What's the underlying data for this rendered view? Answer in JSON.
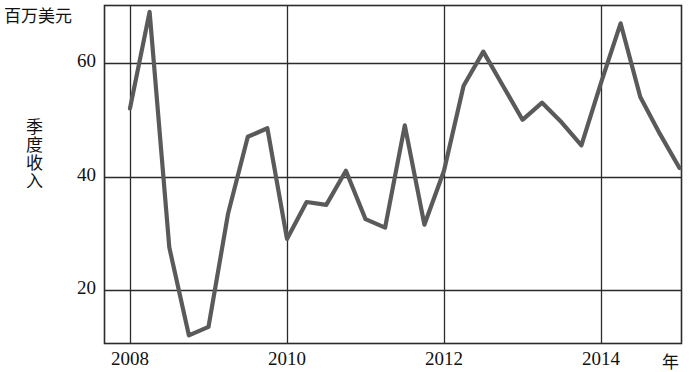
{
  "chart_data": {
    "type": "line",
    "title": "",
    "subtitle": "",
    "unit_label": "百万美元",
    "ylabel": "季度收入",
    "xlabel": "年",
    "grid": true,
    "legend": false,
    "line_color": "#5a5a5a",
    "axis_color": "#2b2b2b",
    "xlim": [
      2007.75,
      2015.25
    ],
    "ylim": [
      8,
      72
    ],
    "yticks": [
      20,
      40,
      60
    ],
    "ytick_labels": [
      "20",
      "40",
      "60"
    ],
    "xticks": [
      2008,
      2010,
      2012,
      2014
    ],
    "xtick_labels": [
      "2008",
      "2010",
      "2012",
      "2014"
    ],
    "x": [
      2008.0,
      2008.25,
      2008.5,
      2008.75,
      2009.0,
      2009.25,
      2009.5,
      2009.75,
      2010.0,
      2010.25,
      2010.5,
      2010.75,
      2011.0,
      2011.25,
      2011.5,
      2011.75,
      2012.0,
      2012.25,
      2012.5,
      2012.75,
      2013.0,
      2013.25,
      2013.5,
      2013.75,
      2014.0,
      2014.25,
      2014.5,
      2014.75,
      2015.0
    ],
    "values": [
      52.0,
      69.0,
      27.5,
      12.0,
      13.5,
      33.5,
      47.0,
      48.5,
      29.0,
      35.5,
      35.0,
      41.0,
      32.5,
      31.0,
      49.0,
      31.5,
      41.0,
      56.0,
      62.0,
      56.0,
      50.0,
      53.0,
      49.5,
      45.5,
      56.5,
      67.0,
      54.0,
      47.5,
      41.5
    ],
    "series": [
      {
        "name": "季度收入",
        "values": [
          52.0,
          69.0,
          27.5,
          12.0,
          13.5,
          33.5,
          47.0,
          48.5,
          29.0,
          35.5,
          35.0,
          41.0,
          32.5,
          31.0,
          49.0,
          31.5,
          41.0,
          56.0,
          62.0,
          56.0,
          50.0,
          53.0,
          49.5,
          45.5,
          56.5,
          67.0,
          54.0,
          47.5,
          41.5
        ]
      }
    ]
  },
  "axis": {
    "unit": "百万美元",
    "y_title": "季度收入",
    "x_title": "年",
    "y_labels": [
      "60",
      "40",
      "20"
    ],
    "x_labels": [
      "2008",
      "2010",
      "2012",
      "2014"
    ]
  }
}
